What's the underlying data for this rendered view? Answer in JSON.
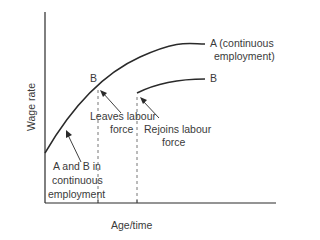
{
  "diagram": {
    "axes": {
      "y_label": "Wage rate",
      "x_label": "Age/time"
    },
    "curves": [
      {
        "id": "A",
        "label": "A (continuous",
        "label_line2": "employment)"
      },
      {
        "id": "B",
        "label": "B"
      }
    ],
    "point_labels": {
      "b_leave": "B"
    },
    "annotations": {
      "leaves_line1": "Leaves labour",
      "leaves_line2": "force",
      "rejoins_line1": "Rejoins labour",
      "rejoins_line2": "force",
      "continuous_line1": "A and B in",
      "continuous_line2": "continuous",
      "continuous_line3": "employment"
    },
    "colors": {
      "line": "#2a2a2a",
      "text": "#3a3a3a",
      "dashed": "#777777"
    }
  }
}
